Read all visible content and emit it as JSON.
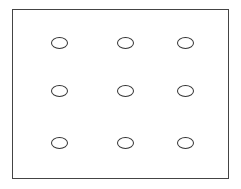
{
  "diagram": {
    "type": "grid-of-ellipses",
    "rows": 3,
    "columns": 3,
    "border_color": "#444444",
    "ellipse_color": "#333333",
    "ellipses": [
      {
        "row": 1,
        "col": 1,
        "cx": 59,
        "cy": 43
      },
      {
        "row": 1,
        "col": 2,
        "cx": 125,
        "cy": 43
      },
      {
        "row": 1,
        "col": 3,
        "cx": 185,
        "cy": 43
      },
      {
        "row": 2,
        "col": 1,
        "cx": 59,
        "cy": 91
      },
      {
        "row": 2,
        "col": 2,
        "cx": 125,
        "cy": 91
      },
      {
        "row": 2,
        "col": 3,
        "cx": 185,
        "cy": 91
      },
      {
        "row": 3,
        "col": 1,
        "cx": 59,
        "cy": 143
      },
      {
        "row": 3,
        "col": 2,
        "cx": 125,
        "cy": 143
      },
      {
        "row": 3,
        "col": 3,
        "cx": 185,
        "cy": 143
      }
    ]
  }
}
